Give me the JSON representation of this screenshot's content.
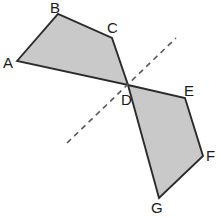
{
  "figure": {
    "width": 221,
    "height": 217,
    "background_color": "#ffffff",
    "fill_color": "#c9c9c9",
    "outline_color": "#2b2b2b",
    "dashed_line_color": "#585858"
  },
  "shapes": [
    {
      "name": "quadrilateral-abcd",
      "vertices": [
        "A",
        "B",
        "C",
        "D"
      ],
      "points": "17,61 58,14 112,38 128,85"
    },
    {
      "name": "quadrilateral-defg",
      "vertices": [
        "D",
        "E",
        "F",
        "G"
      ],
      "points": "128,85 185,98 203,156 159,198"
    }
  ],
  "dashed_line": {
    "name": "axis-of-symmetry",
    "x1": 67,
    "y1": 143,
    "x2": 176,
    "y2": 38
  },
  "labels": [
    {
      "text": "A",
      "x": 3,
      "y": 55
    },
    {
      "text": "B",
      "x": 50,
      "y": 0
    },
    {
      "text": "C",
      "x": 107,
      "y": 20
    },
    {
      "text": "D",
      "x": 121,
      "y": 92
    },
    {
      "text": "E",
      "x": 184,
      "y": 83
    },
    {
      "text": "F",
      "x": 206,
      "y": 148
    },
    {
      "text": "G",
      "x": 151,
      "y": 200
    }
  ]
}
